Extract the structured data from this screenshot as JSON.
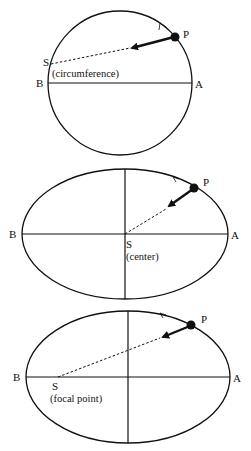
{
  "diagrams": [
    {
      "shape": "circle",
      "labels": {
        "point": "P",
        "left": "B",
        "right": "A",
        "source": "S",
        "source_note": "(circumference)"
      }
    },
    {
      "shape": "ellipse",
      "labels": {
        "point": "P",
        "left": "B",
        "right": "A",
        "source": "S",
        "source_note": "(center)"
      }
    },
    {
      "shape": "ellipse",
      "labels": {
        "point": "P",
        "left": "B",
        "right": "A",
        "source": "S",
        "source_note": "(focal point)"
      }
    }
  ],
  "colors": {
    "stroke": "#111111",
    "background": "#ffffff"
  }
}
